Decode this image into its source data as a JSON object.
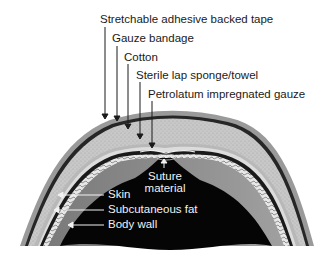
{
  "figure": {
    "type": "cross-section dressing diagram",
    "top_labels": [
      {
        "id": "tape",
        "text": "Stretchable adhesive backed tape"
      },
      {
        "id": "gauze",
        "text": "Gauze bandage"
      },
      {
        "id": "cotton",
        "text": "Cotton"
      },
      {
        "id": "sponge",
        "text": "Sterile lap sponge/towel"
      },
      {
        "id": "petrolatum",
        "text": "Petrolatum impregnated gauze"
      }
    ],
    "inner_labels": [
      {
        "id": "suture",
        "text_line1": "Suture",
        "text_line2": "material"
      },
      {
        "id": "skin",
        "text": "Skin"
      },
      {
        "id": "fat",
        "text": "Subcutaneous fat"
      },
      {
        "id": "wall",
        "text": "Body wall"
      }
    ],
    "colors": {
      "background": "#ffffff",
      "tape": "#9a9a9a",
      "gauze_band": "#2a2a2a",
      "cotton": "#c4c4c4",
      "sponge": "#d8d8d8",
      "skin": "#1a1a1a",
      "fat": "#e6e6e6",
      "body_wall": "#808080",
      "cavity": "#050505",
      "label_text": "#1a1a1a",
      "inner_label_text": "#f2f2f2"
    }
  }
}
